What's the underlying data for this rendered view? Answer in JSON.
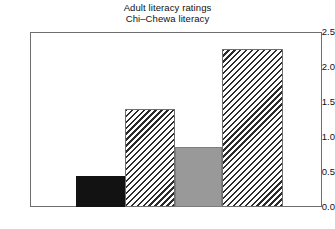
{
  "chart_data": {
    "type": "bar",
    "title": "Adult literacy ratings",
    "subtitle": "Chi–Chewa literacy",
    "xlabel": "",
    "ylabel": "",
    "categories": [
      "1",
      "2",
      "3",
      "4"
    ],
    "values": [
      0.44,
      1.4,
      0.85,
      2.25
    ],
    "series": [
      {
        "name": "Chi-Chewa literacy",
        "values": [
          0.44,
          1.4,
          0.85,
          2.25
        ]
      }
    ],
    "bar_styles": [
      "solid-black",
      "hatch",
      "solid-gray",
      "hatch"
    ],
    "ylim": [
      0.0,
      2.5
    ],
    "ytick_values": [
      0.0,
      0.5,
      1.0,
      1.5,
      2.0,
      2.5
    ],
    "ytick_labels": [
      "0.0",
      "0.5",
      "1.0",
      "1.5",
      "2.0",
      "2.5"
    ],
    "xtick_labels": [],
    "grid": false,
    "legend": false,
    "legend_position": "none",
    "frame": true
  },
  "title": {
    "line1": "Adult literacy ratings",
    "line2": "Chi–Chewa literacy"
  },
  "axis": {
    "y_labels": [
      "2.5",
      "2.0",
      "1.5",
      "1.0",
      "0.5",
      "0.0"
    ]
  },
  "colors": {
    "bar_black": "#121212",
    "bar_gray": "#999999",
    "hatch_stroke": "#2b2b2b",
    "frame": "#6e6e6e",
    "background": "#ffffff",
    "text": "#111111"
  }
}
